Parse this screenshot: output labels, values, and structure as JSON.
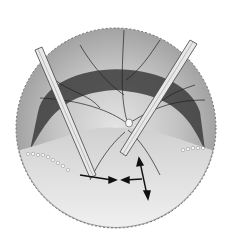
{
  "figure": {
    "background": "#ffffff",
    "colors": {
      "fundus_light": "#d8d8d8",
      "fundus_mid": "#a8a8a8",
      "dark_band": "#3a3a3a",
      "vessel": "#222222",
      "instrument": "#e6e6e6",
      "detached_area": "#efefef",
      "edge": "#555555"
    },
    "elements": [
      "serrated-retina-edge",
      "dark-ring-band",
      "retinal-vessels",
      "optic-disc",
      "left-instrument",
      "right-instrument",
      "detached-retina-flap",
      "laser-spot-chain",
      "direction-arrows"
    ]
  }
}
